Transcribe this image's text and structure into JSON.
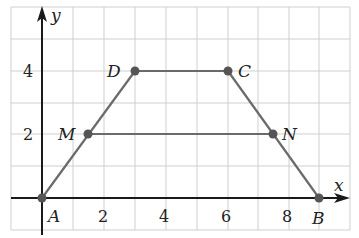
{
  "diagram": {
    "type": "coordinate-plane-trapezoid",
    "axes": {
      "x_label": "x",
      "y_label": "y",
      "x_ticks": [
        {
          "value": 2,
          "label": "2"
        },
        {
          "value": 4,
          "label": "4"
        },
        {
          "value": 6,
          "label": "6"
        },
        {
          "value": 8,
          "label": "8"
        }
      ],
      "y_ticks": [
        {
          "value": 2,
          "label": "2"
        },
        {
          "value": 4,
          "label": "4"
        }
      ],
      "grid_unit": 1,
      "x_range": [
        -1,
        10
      ],
      "y_range": [
        -1,
        6
      ]
    },
    "points": {
      "A": {
        "label": "A",
        "x": 0,
        "y": 0
      },
      "B": {
        "label": "B",
        "x": 9,
        "y": 0
      },
      "C": {
        "label": "C",
        "x": 6,
        "y": 4
      },
      "D": {
        "label": "D",
        "x": 3,
        "y": 4
      },
      "M": {
        "label": "M",
        "x": 1.5,
        "y": 2
      },
      "N": {
        "label": "N",
        "x": 7.5,
        "y": 2
      }
    },
    "segments": [
      "AD",
      "DC",
      "CB",
      "MN"
    ],
    "colors": {
      "grid": "#c8c8c8",
      "axis": "#1a1a1a",
      "shape": "#6a6a6a",
      "point": "#555555"
    }
  }
}
